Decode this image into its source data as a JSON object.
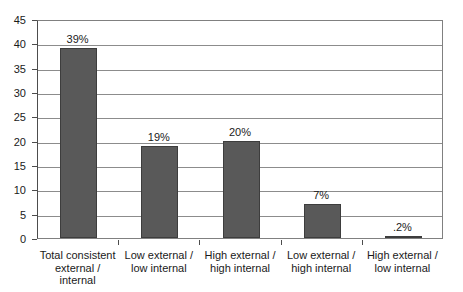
{
  "chart_data": {
    "type": "bar",
    "title": "",
    "subtitle": "",
    "xlabel": "",
    "ylabel": "",
    "ylim": [
      0,
      45
    ],
    "ytick_step": 5,
    "grid": true,
    "legend": "none",
    "orientation": "vertical",
    "bar_color": "#595959",
    "bar_border_color": "#3d3d3d",
    "gridline_color": "#8c8c8c",
    "plot_border_color": "#808080",
    "background_color": "#ffffff",
    "categories": [
      "Total consistent external / internal",
      "Low external / low internal",
      "High external / high internal",
      "Low external / high internal",
      "High external / low internal"
    ],
    "category_lines": [
      [
        "Total consistent",
        "external /",
        "internal"
      ],
      [
        "Low external /",
        "low internal"
      ],
      [
        "High external /",
        "high internal"
      ],
      [
        "Low external /",
        "high internal"
      ],
      [
        "High external /",
        "low internal"
      ]
    ],
    "values": [
      39,
      19,
      20,
      7,
      0.2
    ],
    "data_labels": [
      "39%",
      "19%",
      "20%",
      "7%",
      ".2%"
    ],
    "ytick_labels": [
      "0",
      "5",
      "10",
      "15",
      "20",
      "25",
      "30",
      "35",
      "40",
      "45"
    ],
    "ytick_values": [
      0,
      5,
      10,
      15,
      20,
      25,
      30,
      35,
      40,
      45
    ]
  }
}
